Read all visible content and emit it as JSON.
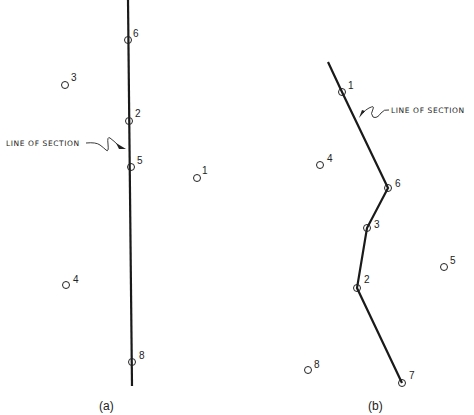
{
  "figure": {
    "line_of_section_label": "LINE OF SECTION",
    "panels": [
      {
        "caption": "(a)",
        "section_line": [
          [
            128,
            0
          ],
          [
            132,
            386
          ]
        ],
        "wells": [
          {
            "id": "6",
            "x": 128,
            "y": 40
          },
          {
            "id": "3",
            "x": 65,
            "y": 85
          },
          {
            "id": "2",
            "x": 129,
            "y": 121
          },
          {
            "id": "5",
            "x": 131,
            "y": 167
          },
          {
            "id": "1",
            "x": 197,
            "y": 178
          },
          {
            "id": "4",
            "x": 66,
            "y": 285
          },
          {
            "id": "8",
            "x": 132,
            "y": 362
          }
        ]
      },
      {
        "caption": "(b)",
        "section_line": [
          [
            328,
            62
          ],
          [
            342,
            92
          ],
          [
            388,
            188
          ],
          [
            367,
            228
          ],
          [
            357,
            288
          ],
          [
            402,
            383
          ]
        ],
        "wells": [
          {
            "id": "1",
            "x": 342,
            "y": 92
          },
          {
            "id": "4",
            "x": 320,
            "y": 165
          },
          {
            "id": "6",
            "x": 388,
            "y": 188
          },
          {
            "id": "3",
            "x": 367,
            "y": 228
          },
          {
            "id": "5",
            "x": 444,
            "y": 267
          },
          {
            "id": "2",
            "x": 357,
            "y": 288
          },
          {
            "id": "8",
            "x": 308,
            "y": 370
          },
          {
            "id": "7",
            "x": 402,
            "y": 383
          }
        ]
      }
    ]
  }
}
